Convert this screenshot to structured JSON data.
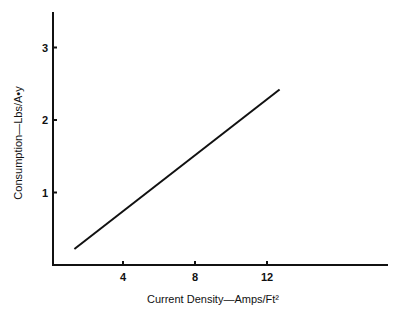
{
  "chart_data": {
    "type": "line",
    "title": "",
    "xlabel": "Current Density—Amps/Ft²",
    "ylabel": "Consumption—Lbs/A•y",
    "x_ticks": [
      "4",
      "8",
      "12"
    ],
    "y_ticks": [
      "1",
      "2",
      "3"
    ],
    "xlim": [
      0,
      18.5
    ],
    "ylim": [
      0,
      3.5
    ],
    "grid": false,
    "legend": null,
    "series": [
      {
        "name": "Consumption",
        "x": [
          1.3,
          12.7
        ],
        "y": [
          0.22,
          2.42
        ]
      }
    ]
  }
}
